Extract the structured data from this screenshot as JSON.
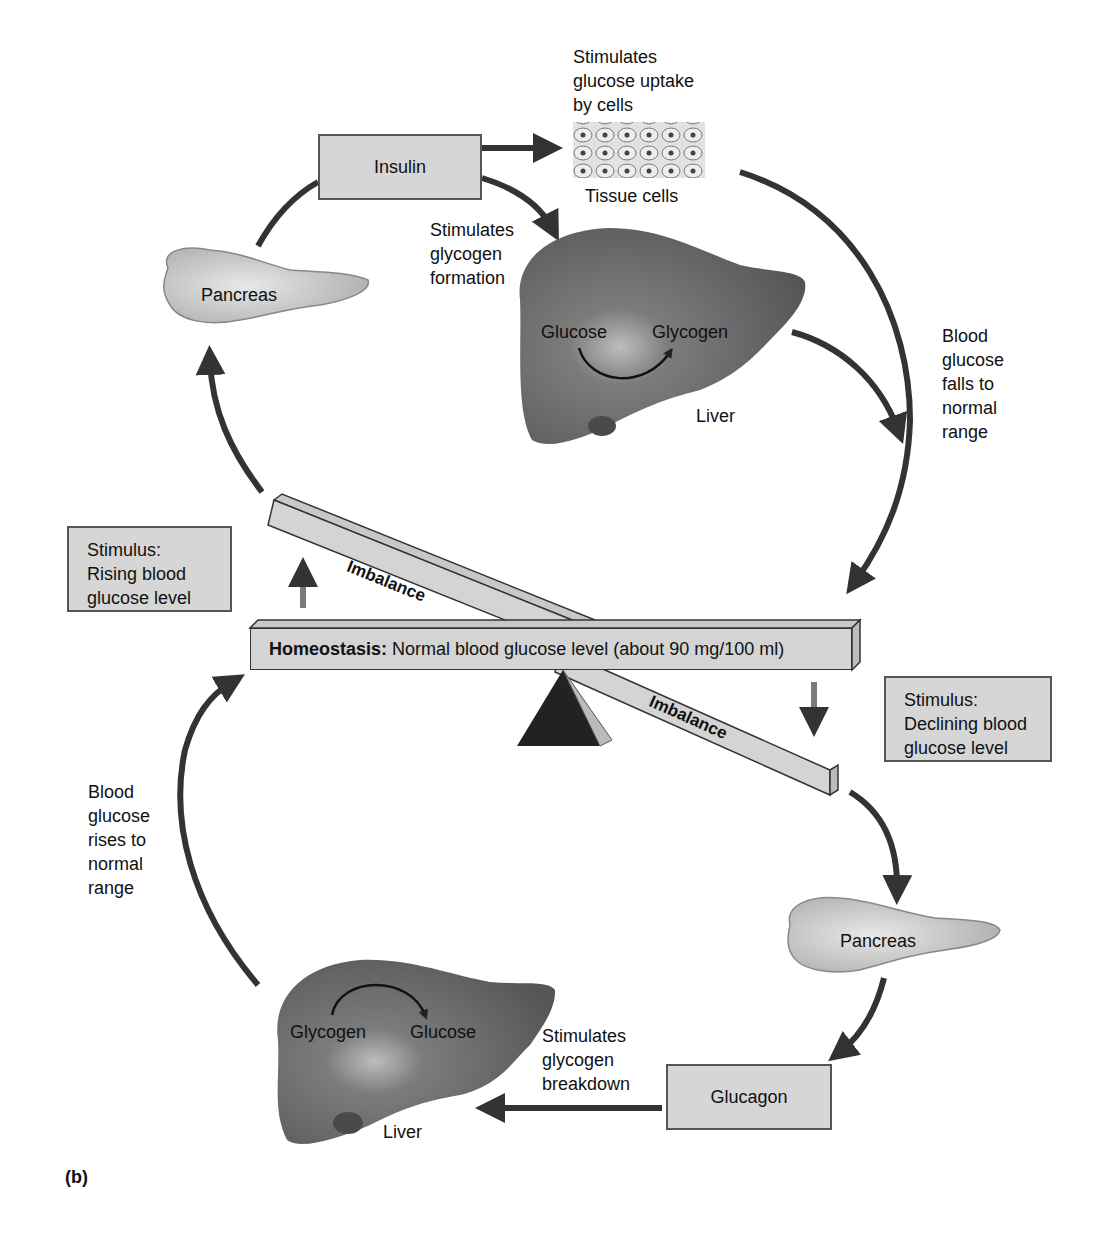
{
  "figure_label": "(b)",
  "homeostasis": {
    "bold_label": "Homeostasis:",
    "text": "Normal blood glucose level (about 90 mg/100 ml)"
  },
  "imbalance_upper": "Imbalance",
  "imbalance_lower": "Imbalance",
  "top_loop": {
    "stimulus": [
      "Stimulus:",
      "Rising blood",
      "glucose level"
    ],
    "pancreas": "Pancreas",
    "hormone": "Insulin",
    "uptake_caption": [
      "Stimulates",
      "glucose uptake",
      "by cells"
    ],
    "tissue_label": "Tissue cells",
    "glycogen_caption": [
      "Stimulates",
      "glycogen",
      "formation"
    ],
    "liver_from": "Glucose",
    "liver_to": "Glycogen",
    "liver_label": "Liver",
    "result": [
      "Blood",
      "glucose",
      "falls to",
      "normal",
      "range"
    ]
  },
  "bottom_loop": {
    "stimulus": [
      "Stimulus:",
      "Declining blood",
      "glucose level"
    ],
    "pancreas": "Pancreas",
    "hormone": "Glucagon",
    "breakdown_caption": [
      "Stimulates",
      "glycogen",
      "breakdown"
    ],
    "liver_from": "Glycogen",
    "liver_to": "Glucose",
    "liver_label": "Liver",
    "result": [
      "Blood",
      "glucose",
      "rises to",
      "normal",
      "range"
    ]
  },
  "colors": {
    "box_fill": "#d6d6d6",
    "arrow": "#333333",
    "stimulus_arrow": "#7a7a7a",
    "liver": "#6a6a6a",
    "fulcrum": "#222222"
  }
}
